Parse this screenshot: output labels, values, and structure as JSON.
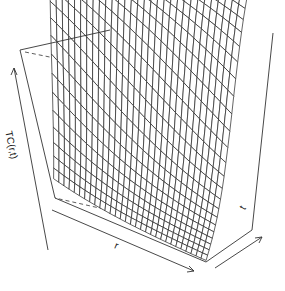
{
  "chart_data": {
    "type": "surface3d",
    "title": "",
    "xlabel": "r",
    "ylabel": "t",
    "zlabel": "TC(r,t)",
    "box": true,
    "ticks": false,
    "grid_lines": {
      "r": 30,
      "t": 30
    },
    "surface": "sigmoidal rise in t, saturating near 1 at the top; rows compress near z=0 at small t",
    "zlim": [
      0,
      1
    ],
    "colors": {
      "line": "#222222",
      "background": "#ffffff"
    }
  }
}
